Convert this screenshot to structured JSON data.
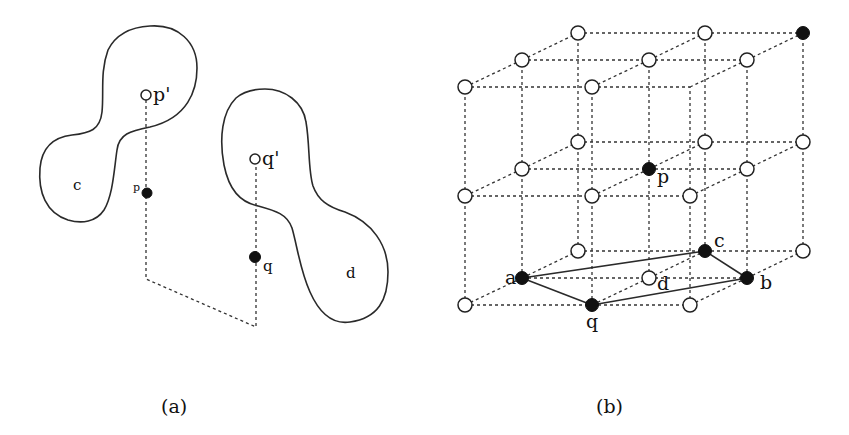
{
  "panel_a": {
    "caption": "(a)",
    "regions": [
      {
        "id": "c",
        "label": "c"
      },
      {
        "id": "d",
        "label": "d"
      }
    ],
    "points": [
      {
        "id": "p_prime",
        "label": "p'",
        "style": "open"
      },
      {
        "id": "p",
        "label": "p",
        "style": "filled"
      },
      {
        "id": "q_prime",
        "label": "q'",
        "style": "open"
      },
      {
        "id": "q",
        "label": "q",
        "style": "filled"
      }
    ],
    "path_description": "dashed path from p' down through p, across to q, and up to q'"
  },
  "panel_b": {
    "caption": "(b)",
    "lattice": "3x3x3 grid of lattice points",
    "labeled_points": [
      {
        "id": "a",
        "label": "a",
        "style": "filled"
      },
      {
        "id": "b",
        "label": "b",
        "style": "filled"
      },
      {
        "id": "c",
        "label": "c",
        "style": "filled"
      },
      {
        "id": "d",
        "label": "d",
        "style": "open"
      },
      {
        "id": "p",
        "label": "p",
        "style": "filled"
      },
      {
        "id": "q",
        "label": "q",
        "style": "filled"
      }
    ],
    "extra_filled_point": "back-top-right corner",
    "solid_edges": [
      [
        "a",
        "c"
      ],
      [
        "a",
        "q"
      ],
      [
        "q",
        "b"
      ],
      [
        "c",
        "b"
      ]
    ]
  }
}
